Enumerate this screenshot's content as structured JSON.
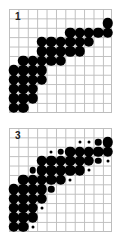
{
  "grid": {
    "cols": 11,
    "rows": 11,
    "cell_px": 9.4
  },
  "panels": [
    {
      "label": "1",
      "top": 9,
      "rows": [
        {
          "r": 1,
          "dots": [
            [
              10,
              "L"
            ]
          ]
        },
        {
          "r": 2,
          "dots": [
            [
              6,
              "L"
            ],
            [
              7,
              "L"
            ],
            [
              8,
              "L"
            ],
            [
              9,
              "L"
            ],
            [
              10,
              "L"
            ]
          ]
        },
        {
          "r": 3,
          "dots": [
            [
              3,
              "L"
            ],
            [
              4,
              "L"
            ],
            [
              5,
              "L"
            ],
            [
              6,
              "L"
            ],
            [
              7,
              "L"
            ],
            [
              8,
              "L"
            ]
          ]
        },
        {
          "r": 4,
          "dots": [
            [
              3,
              "L"
            ],
            [
              4,
              "L"
            ],
            [
              5,
              "L"
            ],
            [
              6,
              "L"
            ],
            [
              7,
              "L"
            ]
          ]
        },
        {
          "r": 5,
          "dots": [
            [
              1,
              "L"
            ],
            [
              2,
              "L"
            ],
            [
              3,
              "L"
            ],
            [
              4,
              "L"
            ],
            [
              5,
              "L"
            ]
          ]
        },
        {
          "r": 6,
          "dots": [
            [
              0,
              "L"
            ],
            [
              1,
              "L"
            ],
            [
              2,
              "L"
            ],
            [
              3,
              "L"
            ]
          ]
        },
        {
          "r": 7,
          "dots": [
            [
              0,
              "L"
            ],
            [
              1,
              "L"
            ],
            [
              2,
              "L"
            ],
            [
              3,
              "L"
            ]
          ]
        },
        {
          "r": 8,
          "dots": [
            [
              0,
              "L"
            ],
            [
              1,
              "L"
            ],
            [
              2,
              "L"
            ]
          ]
        },
        {
          "r": 9,
          "dots": [
            [
              0,
              "L"
            ],
            [
              1,
              "L"
            ],
            [
              2,
              "L"
            ]
          ]
        },
        {
          "r": 10,
          "dots": [
            [
              0,
              "L"
            ],
            [
              1,
              "L"
            ]
          ]
        }
      ]
    },
    {
      "label": "3",
      "top": 128,
      "rows": [
        {
          "r": 1,
          "dots": [
            [
              7,
              "S"
            ],
            [
              8,
              "S"
            ],
            [
              9,
              "M"
            ],
            [
              10,
              "L"
            ]
          ]
        },
        {
          "r": 2,
          "dots": [
            [
              4,
              "S"
            ],
            [
              5,
              "M"
            ],
            [
              6,
              "L"
            ],
            [
              7,
              "L"
            ],
            [
              8,
              "L"
            ],
            [
              9,
              "L"
            ],
            [
              10,
              "L"
            ]
          ]
        },
        {
          "r": 3,
          "dots": [
            [
              3,
              "L"
            ],
            [
              4,
              "L"
            ],
            [
              5,
              "L"
            ],
            [
              6,
              "L"
            ],
            [
              7,
              "L"
            ],
            [
              8,
              "L"
            ],
            [
              9,
              "M"
            ],
            [
              10,
              "S"
            ]
          ]
        },
        {
          "r": 4,
          "dots": [
            [
              2,
              "M"
            ],
            [
              3,
              "L"
            ],
            [
              4,
              "L"
            ],
            [
              5,
              "L"
            ],
            [
              6,
              "L"
            ],
            [
              7,
              "L"
            ],
            [
              8,
              "S"
            ]
          ]
        },
        {
          "r": 5,
          "dots": [
            [
              1,
              "L"
            ],
            [
              2,
              "L"
            ],
            [
              3,
              "L"
            ],
            [
              4,
              "L"
            ],
            [
              5,
              "L"
            ],
            [
              6,
              "S"
            ]
          ]
        },
        {
          "r": 6,
          "dots": [
            [
              0,
              "L"
            ],
            [
              1,
              "L"
            ],
            [
              2,
              "L"
            ],
            [
              3,
              "L"
            ],
            [
              4,
              "M"
            ]
          ]
        },
        {
          "r": 7,
          "dots": [
            [
              0,
              "L"
            ],
            [
              1,
              "L"
            ],
            [
              2,
              "L"
            ],
            [
              3,
              "L"
            ]
          ]
        },
        {
          "r": 8,
          "dots": [
            [
              0,
              "L"
            ],
            [
              1,
              "L"
            ],
            [
              2,
              "L"
            ],
            [
              3,
              "S"
            ]
          ]
        },
        {
          "r": 9,
          "dots": [
            [
              0,
              "L"
            ],
            [
              1,
              "L"
            ],
            [
              2,
              "L"
            ]
          ]
        },
        {
          "r": 10,
          "dots": [
            [
              0,
              "L"
            ],
            [
              1,
              "L"
            ],
            [
              2,
              "S"
            ]
          ]
        }
      ]
    }
  ]
}
